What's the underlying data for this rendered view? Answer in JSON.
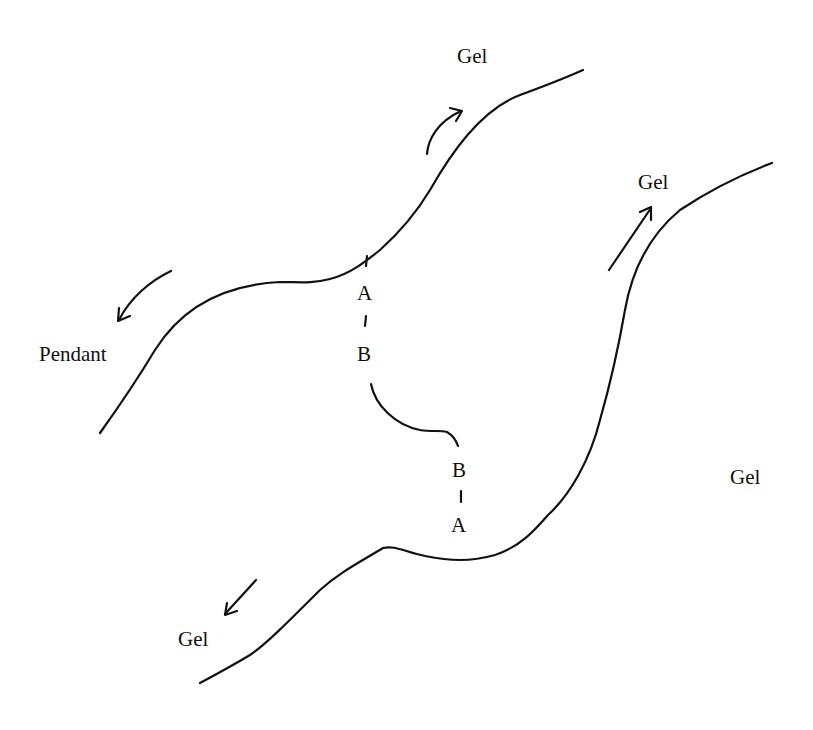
{
  "diagram": {
    "colors": {
      "line": "#111111",
      "background": "#ffffff"
    },
    "labels": {
      "gel_top": "Gel",
      "gel_upper_right": "Gel",
      "gel_right": "Gel",
      "gel_bottom_left": "Gel",
      "pendant": "Pendant",
      "bond_upper_a": "A",
      "bond_upper_b": "B",
      "bond_lower_b": "B",
      "bond_lower_a": "A"
    },
    "curves": [
      {
        "name": "upper-left-surface",
        "role": "pendant/gel boundary"
      },
      {
        "name": "lower-right-surface",
        "role": "gel boundary"
      },
      {
        "name": "bridging-chain",
        "role": "connects B groups"
      }
    ],
    "arrows": [
      {
        "name": "arrow-to-gel-top",
        "direction": "up-right",
        "curved": true
      },
      {
        "name": "arrow-to-pendant",
        "direction": "down-left",
        "curved": true
      },
      {
        "name": "arrow-to-gel-upper-right",
        "direction": "up-right",
        "curved": false
      },
      {
        "name": "arrow-to-gel-bottom-left",
        "direction": "down-left",
        "curved": false
      }
    ]
  }
}
